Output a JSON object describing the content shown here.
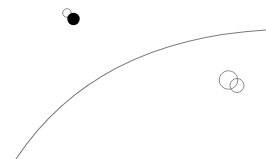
{
  "canvas": {
    "width": 266,
    "height": 159,
    "background": "#ffffff"
  },
  "shapes": {
    "arc": {
      "path": "M 16 159 Q 95 40 266 30",
      "stroke": "#7a7a7a",
      "stroke_width": 1.1
    },
    "small_hollow_circle": {
      "cx": 67,
      "cy": 13,
      "r": 4.3,
      "stroke": "#8a8a8a",
      "fill": "none"
    },
    "filled_circle": {
      "cx": 73.5,
      "cy": 19,
      "r": 6.2,
      "fill": "#000000"
    },
    "large_hollow_circle": {
      "cx": 228.5,
      "cy": 80,
      "r": 9.3,
      "stroke": "#8a8a8a",
      "fill": "none"
    },
    "medium_hollow_circle": {
      "cx": 237,
      "cy": 85.5,
      "r": 7,
      "stroke": "#8a8a8a",
      "fill": "none"
    }
  }
}
